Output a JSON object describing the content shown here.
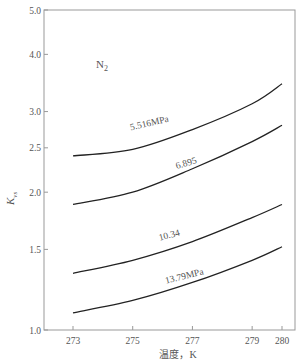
{
  "chart_data": {
    "type": "line",
    "title": "",
    "annotation": "N₂",
    "xlabel": "温度，K",
    "ylabel": "K_vs",
    "ylabel_main": "K",
    "ylabel_sub": "vs",
    "yscale": "log",
    "xlim": [
      273,
      280
    ],
    "ylim": [
      1.0,
      5.0
    ],
    "x_ticks": [
      273,
      275,
      277,
      279,
      280
    ],
    "x_tick_labels": [
      "273",
      "275",
      "277",
      "279",
      "280"
    ],
    "y_ticks": [
      1.0,
      1.5,
      2.0,
      2.5,
      3.0,
      4.0,
      5.0
    ],
    "y_tick_labels": [
      "1.0",
      "1.5",
      "2.0",
      "2.5",
      "3.0",
      "4.0",
      "5.0"
    ],
    "grid": false,
    "x": [
      273,
      275,
      277,
      279,
      280
    ],
    "series": [
      {
        "name": "5.516MPa",
        "label": "5.516MPa",
        "values": [
          2.4,
          2.48,
          2.74,
          3.12,
          3.45
        ]
      },
      {
        "name": "6.895",
        "label": "6.895",
        "values": [
          1.88,
          2.0,
          2.25,
          2.58,
          2.8
        ]
      },
      {
        "name": "10.34",
        "label": "10.34",
        "values": [
          1.33,
          1.42,
          1.56,
          1.76,
          1.88
        ]
      },
      {
        "name": "13.79MPa",
        "label": "13.79MPa",
        "values": [
          1.09,
          1.16,
          1.27,
          1.42,
          1.52
        ]
      }
    ]
  }
}
